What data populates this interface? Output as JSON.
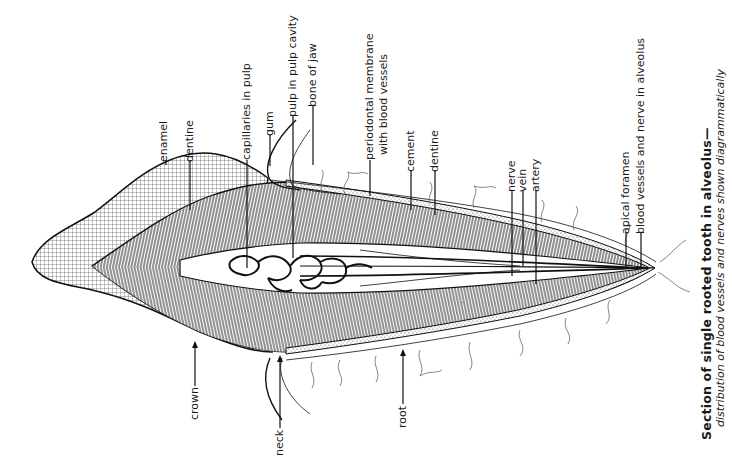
{
  "diagram": {
    "colors": {
      "ink": "#1a1a1a",
      "hatch": "#444444",
      "paper": "#ffffff"
    },
    "labels_top": [
      {
        "id": "enamel",
        "text": "enamel"
      },
      {
        "id": "dentine-crown",
        "text": "dentine"
      },
      {
        "id": "capillaries",
        "text": "capillaries in pulp"
      },
      {
        "id": "gum",
        "text": "gum"
      },
      {
        "id": "pulp",
        "text": "pulp in pulp cavity"
      },
      {
        "id": "bone",
        "text": "bone of jaw"
      },
      {
        "id": "periodontal-1",
        "text": "periodontal membrane"
      },
      {
        "id": "periodontal-2",
        "text": "with blood vessels"
      },
      {
        "id": "cement",
        "text": "cement"
      },
      {
        "id": "dentine-root",
        "text": "dentine"
      },
      {
        "id": "nerve",
        "text": "nerve"
      },
      {
        "id": "vein",
        "text": "vein"
      },
      {
        "id": "artery",
        "text": "artery"
      },
      {
        "id": "apical-foramen",
        "text": "apical foramen"
      },
      {
        "id": "alveolus-vessels",
        "text": "blood vessels and nerve in alveolus"
      }
    ],
    "labels_bottom": [
      {
        "id": "crown",
        "text": "crown"
      },
      {
        "id": "neck",
        "text": "neck"
      },
      {
        "id": "root",
        "text": "root"
      }
    ],
    "caption": {
      "title": "Section of single rooted tooth in alveolus—",
      "subtitle_a": "distribution of ",
      "subtitle_b": "blood vessels",
      "subtitle_c": " and ",
      "subtitle_d": "nerves",
      "subtitle_e": " shown ",
      "subtitle_f": "diagrammatically"
    }
  }
}
